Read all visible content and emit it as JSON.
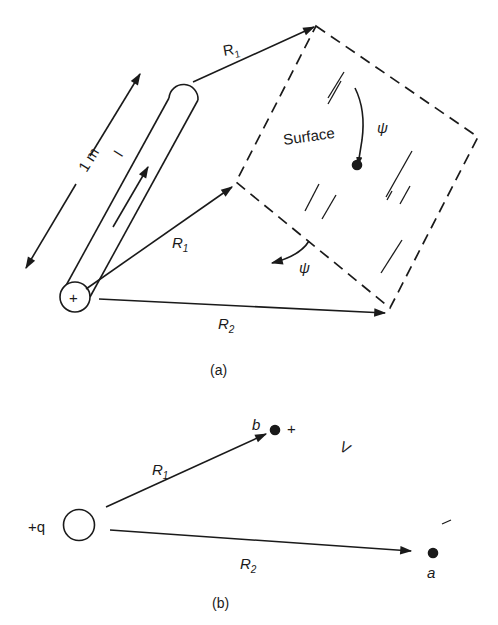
{
  "figure_a": {
    "caption": "(a)",
    "length_label": "1 m",
    "current_label": "I",
    "surface_label": "Surface",
    "flux_symbol": "ψ",
    "flux_symbol_lower": "ψ",
    "line_charge_symbol": "+",
    "r1_upper": {
      "letter": "R",
      "subscript": "1"
    },
    "r1_lower": {
      "letter": "R",
      "subscript": "1"
    },
    "r2": {
      "letter": "R",
      "subscript": "2"
    }
  },
  "figure_b": {
    "caption": "(b)",
    "charge_label": "+q",
    "point_b": {
      "label": "b",
      "polarity": "+"
    },
    "point_a": {
      "label": "a",
      "polarity": "−"
    },
    "voltage_label": "V",
    "r1": {
      "letter": "R",
      "subscript": "1"
    },
    "r2": {
      "letter": "R",
      "subscript": "2"
    }
  },
  "colors": {
    "ink": "#1a1a1a",
    "background": "#ffffff"
  }
}
